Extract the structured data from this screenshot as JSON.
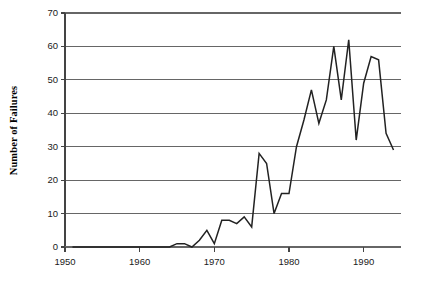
{
  "chart_data": {
    "type": "line",
    "title": "",
    "subtitle": "",
    "xlabel": "",
    "ylabel": "Number of Failures",
    "xlim": [
      1950,
      1995
    ],
    "ylim": [
      0,
      70
    ],
    "grid": true,
    "grid_axis": "y",
    "legend": null,
    "annotations": [],
    "x_ticks": [
      1950,
      1960,
      1970,
      1980,
      1990
    ],
    "x_tick_labels": [
      "1950",
      "1960",
      "1970",
      "1980",
      "1990"
    ],
    "y_ticks": [
      0,
      10,
      20,
      30,
      40,
      50,
      60,
      70
    ],
    "y_tick_labels": [
      "0",
      "10",
      "20",
      "30",
      "40",
      "50",
      "60",
      "70"
    ],
    "line_color": "#222222",
    "series": [
      {
        "name": "Number of Failures",
        "x": [
          1951,
          1952,
          1953,
          1954,
          1955,
          1956,
          1957,
          1958,
          1959,
          1960,
          1961,
          1962,
          1963,
          1964,
          1965,
          1966,
          1967,
          1968,
          1969,
          1970,
          1971,
          1972,
          1973,
          1974,
          1975,
          1976,
          1977,
          1978,
          1979,
          1980,
          1981,
          1982,
          1983,
          1984,
          1985,
          1986,
          1987,
          1988,
          1989,
          1990,
          1991,
          1992,
          1993,
          1994
        ],
        "values": [
          0,
          0,
          0,
          0,
          0,
          0,
          0,
          0,
          0,
          0,
          0,
          0,
          0,
          0,
          1,
          1,
          0,
          2,
          5,
          1,
          8,
          8,
          7,
          9,
          6,
          28,
          25,
          10,
          16,
          16,
          30,
          38,
          47,
          37,
          44,
          60,
          44,
          62,
          32,
          49,
          57,
          56,
          34,
          29
        ]
      }
    ]
  },
  "plot_geometry": {
    "left": 65,
    "right": 401,
    "top": 13,
    "bottom": 247
  }
}
